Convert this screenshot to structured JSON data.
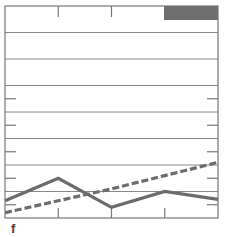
{
  "panel_label": "f",
  "colors": {
    "frame": "#777777",
    "grid": "#888888",
    "solid_series": "#6b6b6b",
    "dashed_series": "#6b6b6b",
    "corner_box": "#6e6e6e"
  },
  "chart_data": {
    "type": "line",
    "title": "",
    "xlabel": "",
    "ylabel": "",
    "x": [
      0,
      1,
      2,
      3,
      4
    ],
    "xlim": [
      0,
      4
    ],
    "ylim": [
      0,
      8
    ],
    "grid": true,
    "ygrid_lines": [
      1,
      2,
      3,
      4,
      5,
      6,
      7
    ],
    "legend": null,
    "series": [
      {
        "name": "solid",
        "style": "solid",
        "values": [
          0.65,
          1.5,
          0.4,
          1.0,
          0.7
        ]
      },
      {
        "name": "dashed",
        "style": "dashed",
        "values": [
          0.2,
          0.65,
          1.1,
          1.6,
          2.1
        ]
      }
    ],
    "annotations": [
      "dark filled box at top-right corner"
    ]
  }
}
